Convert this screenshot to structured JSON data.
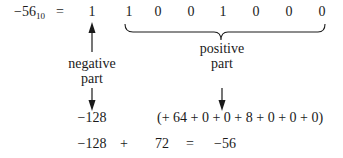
{
  "equation": {
    "lhs_value": "−56",
    "lhs_base": "10",
    "equals": "="
  },
  "bits": [
    "1",
    "1",
    "0",
    "0",
    "1",
    "0",
    "0",
    "0"
  ],
  "labels": {
    "negative_part_line1": "negative",
    "negative_part_line2": "part",
    "positive_part_line1": "positive",
    "positive_part_line2": "part"
  },
  "expansion": {
    "negative_value": "−128",
    "positive_sum": "(+ 64 + 0 + 0 + 8 + 0 + 0 + 0)"
  },
  "result": {
    "negative_value": "−128",
    "plus": "+",
    "positive_value": "72",
    "equals": "=",
    "total": "−56"
  },
  "colors": {
    "ink": "#1a1a1a",
    "background": "#ffffff"
  }
}
